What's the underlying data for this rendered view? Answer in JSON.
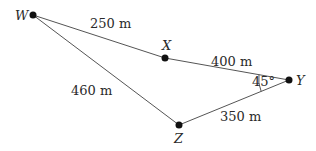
{
  "diagram": {
    "points": [
      {
        "id": "W",
        "label": "W",
        "x": 33,
        "y": 15
      },
      {
        "id": "X",
        "label": "X",
        "x": 165,
        "y": 58
      },
      {
        "id": "Y",
        "label": "Y",
        "x": 289,
        "y": 80
      },
      {
        "id": "Z",
        "label": "Z",
        "x": 179,
        "y": 125
      }
    ],
    "segments": [
      {
        "from": "W",
        "to": "X",
        "length": "250 m"
      },
      {
        "from": "X",
        "to": "Y",
        "length": "400 m"
      },
      {
        "from": "W",
        "to": "Z",
        "length": "460 m"
      },
      {
        "from": "Z",
        "to": "Y",
        "length": "350 m"
      }
    ],
    "angle": {
      "vertex": "Y",
      "label": "45°"
    },
    "line_color": "#555555",
    "point_color": "#111111"
  }
}
